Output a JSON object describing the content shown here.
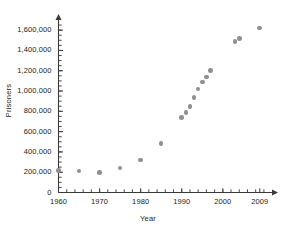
{
  "chart_data": {
    "type": "scatter",
    "title": "",
    "xlabel": "Year",
    "ylabel": "Prisoners",
    "xlim": [
      1960,
      2011
    ],
    "ylim": [
      0,
      1700000
    ],
    "grid": false,
    "legend": "none",
    "marker_color": "#8f8f8f",
    "axis_color": "#3a3a3a",
    "x_tick_labels": [
      "1960",
      "1970",
      "1980",
      "1990",
      "2000",
      "2009"
    ],
    "x_tick_values": [
      1960,
      1970,
      1980,
      1990,
      2000,
      2009
    ],
    "x_minor_tick_step": 2,
    "y_tick_labels": [
      "0",
      "200,000",
      "400,000",
      "600,000",
      "800,000",
      "1,000,000",
      "1,200,000",
      "1,400,000",
      "1,600,000"
    ],
    "y_tick_values": [
      0,
      200000,
      400000,
      600000,
      800000,
      1000000,
      1200000,
      1400000,
      1600000
    ],
    "y_minor_tick_step": 50000,
    "points": [
      {
        "x": 1960,
        "y": 215000
      },
      {
        "x": 1965,
        "y": 210000
      },
      {
        "x": 1970,
        "y": 196000
      },
      {
        "x": 1975,
        "y": 240000
      },
      {
        "x": 1980,
        "y": 320000
      },
      {
        "x": 1985,
        "y": 480000
      },
      {
        "x": 1990,
        "y": 740000
      },
      {
        "x": 1991,
        "y": 790000
      },
      {
        "x": 1992,
        "y": 850000
      },
      {
        "x": 1993,
        "y": 935000
      },
      {
        "x": 1994,
        "y": 1020000
      },
      {
        "x": 1995,
        "y": 1090000
      },
      {
        "x": 1996,
        "y": 1140000
      },
      {
        "x": 1997,
        "y": 1200000
      },
      {
        "x": 2003,
        "y": 1490000
      },
      {
        "x": 2004,
        "y": 1515000
      },
      {
        "x": 2009,
        "y": 1620000
      }
    ]
  }
}
